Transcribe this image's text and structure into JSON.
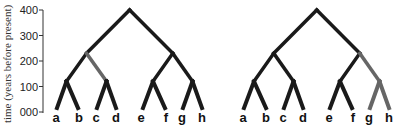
{
  "axis": {
    "title": "time (years before present)",
    "ticks": [
      "400",
      "300",
      "200",
      "100",
      "000"
    ],
    "tick_values": [
      400,
      300,
      200,
      100,
      0
    ],
    "range": [
      0,
      400
    ]
  },
  "colors": {
    "branch": "#1a1a1a",
    "highlight": "#666666"
  },
  "trees": [
    {
      "name": "tree-1",
      "leaves": [
        "a",
        "b",
        "c",
        "d",
        "e",
        "f",
        "g",
        "h"
      ],
      "nodes": {
        "root": 400,
        "abcd": 230,
        "efgh": 230,
        "ab": 120,
        "cd": 120,
        "ef": 120,
        "gh": 120,
        "leaf": 0
      },
      "highlighted_branches": [
        "abcd-cd"
      ]
    },
    {
      "name": "tree-2",
      "leaves": [
        "a",
        "b",
        "c",
        "d",
        "e",
        "f",
        "g",
        "h"
      ],
      "nodes": {
        "root": 400,
        "abcd": 230,
        "efgh": 230,
        "ab": 120,
        "cd": 120,
        "ef": 120,
        "gh": 120,
        "leaf": 0
      },
      "highlighted_branches": [
        "efgh-gh",
        "gh-g",
        "gh-h"
      ]
    }
  ]
}
